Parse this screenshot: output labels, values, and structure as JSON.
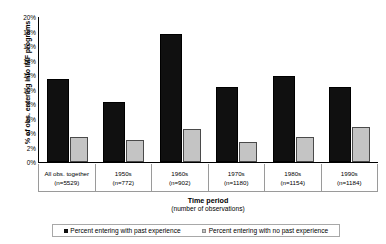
{
  "chart_data": {
    "type": "bar",
    "title": "",
    "xlabel": "Time period",
    "xlabel_sub": "(number of observations)",
    "ylabel": "% of obs. entering into IMF programs",
    "ylim": [
      0,
      20
    ],
    "ytick_labels": [
      "20%",
      "18%",
      "16%",
      "14%",
      "12%",
      "10%",
      "8%",
      "6%",
      "4%",
      "2%",
      "0%"
    ],
    "ytick_values": [
      20,
      18,
      16,
      14,
      12,
      10,
      8,
      6,
      4,
      2,
      0
    ],
    "grid": false,
    "legend_position": "bottom",
    "categories": [
      "All obs. together",
      "1950s",
      "1960s",
      "1970s",
      "1980s",
      "1990s"
    ],
    "category_counts": [
      "(n=5529)",
      "(n=772)",
      "(n=902)",
      "(n=1180)",
      "(n=1154)",
      "(n=1184)"
    ],
    "series": [
      {
        "name": "Percent entering with past experience",
        "color": "#101010",
        "values": [
          11.5,
          8.3,
          17.6,
          10.4,
          11.9,
          10.4
        ]
      },
      {
        "name": "Percent entering with no past experience",
        "color": "#c4c4c4",
        "values": [
          3.5,
          3.1,
          4.5,
          2.8,
          3.4,
          4.8
        ]
      }
    ]
  }
}
